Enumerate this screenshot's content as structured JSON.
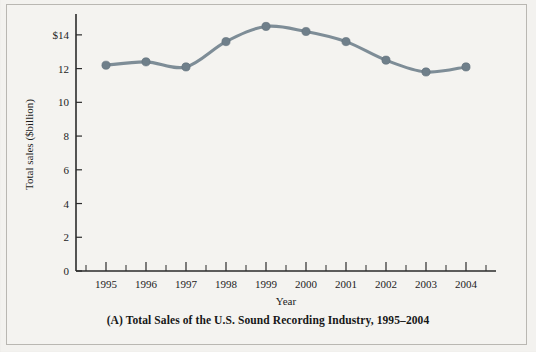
{
  "figure": {
    "caption": "(A) Total Sales of the U.S. Sound Recording Industry, 1995–2004",
    "background_color": "#f3f2ef",
    "border_color": "#b9b7b2"
  },
  "chart_data": {
    "type": "line",
    "title": "",
    "xlabel": "Year",
    "ylabel": "Total sales ($billion)",
    "categories": [
      "1995",
      "1996",
      "1997",
      "1998",
      "1999",
      "2000",
      "2001",
      "2002",
      "2003",
      "2004"
    ],
    "values": [
      12.2,
      12.4,
      12.1,
      13.6,
      14.5,
      14.2,
      13.6,
      12.5,
      11.8,
      12.1
    ],
    "series": [
      {
        "name": "Total sales",
        "values": [
          12.2,
          12.4,
          12.1,
          13.6,
          14.5,
          14.2,
          13.6,
          12.5,
          11.8,
          12.1
        ]
      }
    ],
    "ylim": [
      0,
      15
    ],
    "yticks": [
      0,
      2,
      4,
      6,
      8,
      10,
      12,
      14
    ],
    "ytick_labels": [
      "0",
      "2",
      "4",
      "6",
      "8",
      "10",
      "12",
      "$14"
    ],
    "xtick_labels": [
      "1995",
      "1996",
      "1997",
      "1998",
      "1999",
      "2000",
      "2001",
      "2002",
      "2003",
      "2004"
    ],
    "grid": false,
    "legend": false,
    "line_color": "#7e8d97",
    "marker_color": "#6f7f8a",
    "axis_color": "#2b2b2b"
  }
}
